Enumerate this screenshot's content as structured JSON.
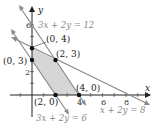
{
  "axes": {
    "x_label": "x",
    "y_label": "y",
    "x_ticks": [
      "4",
      "6",
      "8"
    ],
    "y_ticks": [
      "2",
      "6"
    ]
  },
  "lines": [
    {
      "equation": "3x + 2y = 12"
    },
    {
      "equation": "3x + 2y = 6"
    },
    {
      "equation": "x + 2y = 8"
    }
  ],
  "points": [
    {
      "label": "(0, 4)"
    },
    {
      "label": "(2, 3)"
    },
    {
      "label": "(0, 3)"
    },
    {
      "label": "(2, 0)"
    },
    {
      "label": "(4, 0)"
    }
  ],
  "colors": {
    "region": "#d6d6d6",
    "line": "#8a8a8a",
    "axis": "#222222"
  }
}
